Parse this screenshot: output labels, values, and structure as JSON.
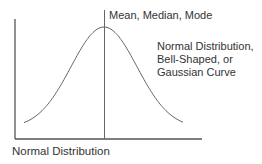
{
  "diagram": {
    "title": "Normal Distribution",
    "mean_label": "Mean, Median, Mode",
    "curve_label_lines": [
      "Normal Distribution,",
      "Bell-Shaped, or",
      "Gaussian Curve"
    ],
    "colors": {
      "axis": "#555555",
      "curve": "#666666",
      "mean_line": "#666666",
      "text": "#333333"
    },
    "geometry": {
      "y_axis": {
        "x": 15,
        "y_top": 19,
        "y_bottom": 139
      },
      "x_axis": {
        "y": 139,
        "x_left": 15,
        "x_right": 202
      },
      "mean_line": {
        "x": 104.5,
        "y_top": 10,
        "y_bottom": 139
      },
      "curve": {
        "center_x": 104,
        "peak_y": 27,
        "base_y": 128,
        "sigma": 33,
        "x_start": 24,
        "x_end": 183
      }
    }
  }
}
